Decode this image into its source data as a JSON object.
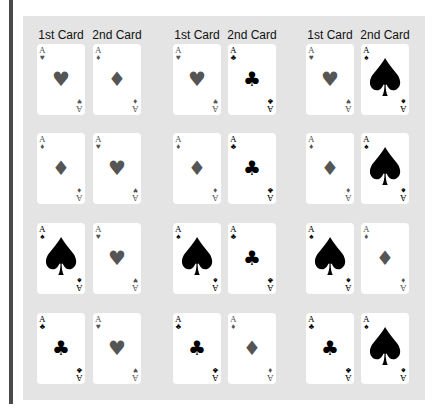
{
  "figure": {
    "colors": {
      "background": "#ffffff",
      "panel": "#e4e4e4",
      "side_bar": "#4a4a4a",
      "card": "#ffffff",
      "red_suit": "#555555",
      "black_suit": "#000000"
    },
    "column_headers": [
      {
        "label": "1st Card"
      },
      {
        "label": "2nd Card"
      },
      {
        "label": "1st Card"
      },
      {
        "label": "2nd Card"
      },
      {
        "label": "1st Card"
      },
      {
        "label": "2nd Card"
      }
    ],
    "groups": [
      {
        "rows": [
          {
            "first": {
              "rank": "A",
              "suit": "hearts",
              "glyph": "♥",
              "color": "red"
            },
            "second": {
              "rank": "A",
              "suit": "diamonds",
              "glyph": "♦",
              "color": "red"
            }
          },
          {
            "first": {
              "rank": "A",
              "suit": "diamonds",
              "glyph": "♦",
              "color": "red"
            },
            "second": {
              "rank": "A",
              "suit": "hearts",
              "glyph": "♥",
              "color": "red"
            }
          },
          {
            "first": {
              "rank": "A",
              "suit": "spades",
              "glyph": "♠",
              "color": "black"
            },
            "second": {
              "rank": "A",
              "suit": "hearts",
              "glyph": "♥",
              "color": "red"
            }
          },
          {
            "first": {
              "rank": "A",
              "suit": "clubs",
              "glyph": "♣",
              "color": "black"
            },
            "second": {
              "rank": "A",
              "suit": "hearts",
              "glyph": "♥",
              "color": "red"
            }
          }
        ]
      },
      {
        "rows": [
          {
            "first": {
              "rank": "A",
              "suit": "hearts",
              "glyph": "♥",
              "color": "red"
            },
            "second": {
              "rank": "A",
              "suit": "clubs",
              "glyph": "♣",
              "color": "black"
            }
          },
          {
            "first": {
              "rank": "A",
              "suit": "diamonds",
              "glyph": "♦",
              "color": "red"
            },
            "second": {
              "rank": "A",
              "suit": "clubs",
              "glyph": "♣",
              "color": "black"
            }
          },
          {
            "first": {
              "rank": "A",
              "suit": "spades",
              "glyph": "♠",
              "color": "black"
            },
            "second": {
              "rank": "A",
              "suit": "clubs",
              "glyph": "♣",
              "color": "black"
            }
          },
          {
            "first": {
              "rank": "A",
              "suit": "clubs",
              "glyph": "♣",
              "color": "black"
            },
            "second": {
              "rank": "A",
              "suit": "diamonds",
              "glyph": "♦",
              "color": "red"
            }
          }
        ]
      },
      {
        "rows": [
          {
            "first": {
              "rank": "A",
              "suit": "hearts",
              "glyph": "♥",
              "color": "red"
            },
            "second": {
              "rank": "A",
              "suit": "spades",
              "glyph": "♠",
              "color": "black"
            }
          },
          {
            "first": {
              "rank": "A",
              "suit": "diamonds",
              "glyph": "♦",
              "color": "red"
            },
            "second": {
              "rank": "A",
              "suit": "spades",
              "glyph": "♠",
              "color": "black"
            }
          },
          {
            "first": {
              "rank": "A",
              "suit": "spades",
              "glyph": "♠",
              "color": "black"
            },
            "second": {
              "rank": "A",
              "suit": "diamonds",
              "glyph": "♦",
              "color": "red"
            }
          },
          {
            "first": {
              "rank": "A",
              "suit": "clubs",
              "glyph": "♣",
              "color": "black"
            },
            "second": {
              "rank": "A",
              "suit": "spades",
              "glyph": "♠",
              "color": "black"
            }
          }
        ]
      }
    ]
  }
}
